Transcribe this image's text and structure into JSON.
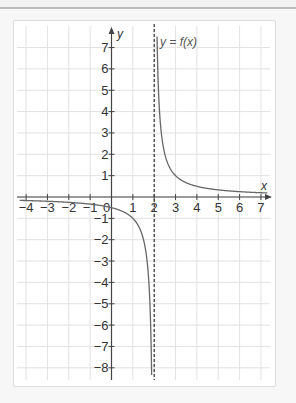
{
  "chart_data": {
    "type": "line",
    "title": "",
    "function_label": "y = f(x)",
    "xlabel": "x",
    "ylabel": "y",
    "xlim": [
      -4.5,
      7.5
    ],
    "ylim": [
      -8.5,
      7.5
    ],
    "x_ticks": [
      -4,
      -3,
      -2,
      -1,
      0,
      1,
      2,
      3,
      4,
      5,
      6,
      7
    ],
    "x_tick_labels": [
      "−4",
      "−3",
      "−2",
      "−1",
      "0",
      "1",
      "2",
      "3",
      "4",
      "5",
      "6",
      "7"
    ],
    "y_ticks": [
      -8,
      -7,
      -6,
      -5,
      -4,
      -3,
      -2,
      -1,
      1,
      2,
      3,
      4,
      5,
      6,
      7
    ],
    "y_tick_labels": [
      "−8",
      "−7",
      "−6",
      "−5",
      "−4",
      "−3",
      "−2",
      "−1",
      "1",
      "2",
      "3",
      "4",
      "5",
      "6",
      "7"
    ],
    "grid": true,
    "vertical_asymptote": 2,
    "series": [
      {
        "name": "f(x) = 1/(x-2)",
        "x": [
          -4,
          -3,
          -2,
          -1,
          0,
          1,
          1.5,
          1.8,
          1.88
        ],
        "y": [
          -0.17,
          -0.2,
          -0.25,
          -0.33,
          -0.5,
          -1,
          -2,
          -5,
          -8.3
        ]
      },
      {
        "name": "f(x) = 1/(x-2) right branch",
        "x": [
          2.13,
          2.2,
          2.5,
          3,
          4,
          5,
          6,
          7
        ],
        "y": [
          7.5,
          5,
          2,
          1,
          0.5,
          0.33,
          0.25,
          0.2
        ]
      }
    ]
  }
}
